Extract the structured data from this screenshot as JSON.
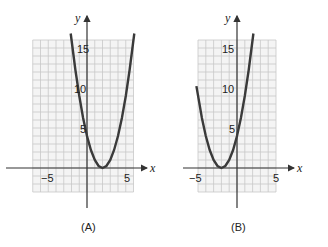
{
  "chart_data": [
    {
      "type": "line",
      "panel": "A",
      "caption": "(A)",
      "xlabel": "x",
      "ylabel": "y",
      "function_shape": "parabola opening upward, vertex at (2, 0)",
      "x_ticks": [
        -5,
        5
      ],
      "y_ticks": [
        5,
        10,
        15
      ],
      "x_tick_labels": [
        "-5",
        "5"
      ],
      "y_tick_labels": [
        "5",
        "10",
        "15"
      ],
      "grid": true,
      "grid_x_range": [
        -7,
        6
      ],
      "grid_y_range": [
        -3,
        16
      ],
      "x": [
        -2.1,
        -1.5,
        -1,
        -0.5,
        0,
        0.5,
        1,
        1.5,
        2,
        2.5,
        3,
        3.5,
        4,
        4.5,
        5,
        5.5,
        6.1
      ],
      "values": [
        16.81,
        12.25,
        9,
        6.25,
        4,
        2.25,
        1,
        0.25,
        0,
        0.25,
        1,
        2.25,
        4,
        6.25,
        9,
        12.25,
        16.81
      ]
    },
    {
      "type": "line",
      "panel": "B",
      "caption": "(B)",
      "xlabel": "x",
      "ylabel": "y",
      "function_shape": "parabola opening upward, vertex at (-2, 0)",
      "x_ticks": [
        -5,
        5
      ],
      "y_ticks": [
        5,
        10,
        15
      ],
      "x_tick_labels": [
        "-5",
        "5"
      ],
      "y_tick_labels": [
        "5",
        "10",
        "15"
      ],
      "grid": true,
      "grid_x_range": [
        -5,
        5
      ],
      "grid_y_range": [
        -3,
        16
      ],
      "x": [
        -5.2,
        -4.5,
        -4,
        -3.5,
        -3,
        -2.5,
        -2,
        -1.5,
        -1,
        -0.5,
        0,
        0.5,
        1,
        1.5,
        2.1
      ],
      "values": [
        10.24,
        6.25,
        4,
        2.25,
        1,
        0.25,
        0,
        0.25,
        1,
        2.25,
        4,
        6.25,
        9,
        12.25,
        16.81
      ]
    }
  ],
  "labels": {
    "A": {
      "caption": "(A)",
      "x_axis": "x",
      "y_axis": "y",
      "xm5": "−5",
      "x5": "5",
      "y5": "5",
      "y10": "10",
      "y15": "15"
    },
    "B": {
      "caption": "(B)",
      "x_axis": "x",
      "y_axis": "y",
      "xm5": "−5",
      "x5": "5",
      "y5": "5",
      "y10": "10",
      "y15": "15"
    }
  },
  "colors": {
    "curve": "#3a3a3a",
    "grid": "#c8c8c8",
    "axis": "#333333"
  }
}
